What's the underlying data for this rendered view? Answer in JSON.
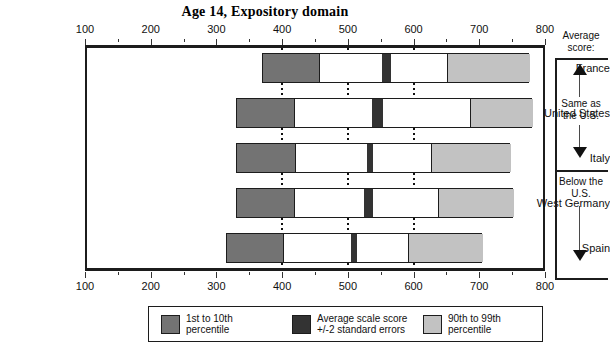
{
  "chart_data": {
    "type": "bar",
    "title": "Age 14, Expository domain",
    "xlabel": "",
    "ylabel": "",
    "xlim": [
      100,
      800
    ],
    "grid": true,
    "gridlines": [
      400,
      500,
      600
    ],
    "xticks_major": [
      100,
      200,
      300,
      400,
      500,
      600,
      700,
      800
    ],
    "xticks_minor": [
      150,
      250,
      350,
      450,
      550,
      650,
      750
    ],
    "categories": [
      "France",
      "United States",
      "Italy",
      "West Germany",
      "Spain"
    ],
    "legend_position": "bottom",
    "series": [
      {
        "name": "1st to 10th percentile",
        "color": "#737373",
        "ranges": [
          {
            "category": "France",
            "start": 370,
            "end": 456
          },
          {
            "category": "United States",
            "start": 330,
            "end": 418
          },
          {
            "category": "Italy",
            "start": 330,
            "end": 420
          },
          {
            "category": "West Germany",
            "start": 330,
            "end": 418
          },
          {
            "category": "Spain",
            "start": 315,
            "end": 402
          }
        ]
      },
      {
        "name": "Average scale score +/-2 standard errors",
        "color": "#333333",
        "ranges": [
          {
            "category": "France",
            "start": 550,
            "end": 564
          },
          {
            "category": "United States",
            "start": 535,
            "end": 552
          },
          {
            "category": "Italy",
            "start": 527,
            "end": 537
          },
          {
            "category": "West Germany",
            "start": 523,
            "end": 537
          },
          {
            "category": "Spain",
            "start": 503,
            "end": 512
          }
        ]
      },
      {
        "name": "90th to 99th percentile",
        "color": "#c2c2c2",
        "ranges": [
          {
            "category": "France",
            "start": 650,
            "end": 776
          },
          {
            "category": "United States",
            "start": 685,
            "end": 780
          },
          {
            "category": "Italy",
            "start": 625,
            "end": 747
          },
          {
            "category": "West Germany",
            "start": 635,
            "end": 752
          },
          {
            "category": "Spain",
            "start": 590,
            "end": 704
          }
        ]
      }
    ],
    "bar_extents": [
      {
        "category": "France",
        "low": 370,
        "high": 776
      },
      {
        "category": "United States",
        "low": 330,
        "high": 780
      },
      {
        "category": "Italy",
        "low": 330,
        "high": 747
      },
      {
        "category": "West Germany",
        "low": 330,
        "high": 752
      },
      {
        "category": "Spain",
        "low": 315,
        "high": 704
      }
    ],
    "annotations": {
      "header": "Average score:",
      "groups": [
        {
          "label": "Same as the U.S.",
          "categories": [
            "France",
            "United States",
            "Italy"
          ]
        },
        {
          "label": "Below the U.S.",
          "categories": [
            "West Germany",
            "Spain"
          ]
        }
      ]
    }
  },
  "title": "Age 14, Expository domain",
  "axis": {
    "top_labels": [
      "100",
      "200",
      "300",
      "400",
      "500",
      "600",
      "700",
      "800"
    ],
    "bottom_labels": [
      "100",
      "200",
      "300",
      "400",
      "500",
      "600",
      "700",
      "800"
    ]
  },
  "categories": [
    {
      "label": "France"
    },
    {
      "label": "United States"
    },
    {
      "label": "Italy"
    },
    {
      "label": "West Germany"
    },
    {
      "label": "Spain"
    }
  ],
  "annotation": {
    "header_line1": "Average",
    "header_line2": "score:",
    "group1_line1": "Same as",
    "group1_line2": "the U.S.",
    "group2_line1": "Below the",
    "group2_line2": "U.S."
  },
  "legend": {
    "items": [
      {
        "color": "#737373",
        "line1": "1st to 10th",
        "line2": "percentile"
      },
      {
        "color": "#333333",
        "line1": "Average scale score",
        "line2": "+/-2 standard errors"
      },
      {
        "color": "#c2c2c2",
        "line1": "90th to 99th",
        "line2": "percentile"
      }
    ]
  }
}
